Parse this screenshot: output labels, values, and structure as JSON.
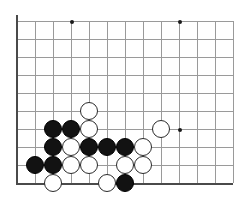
{
  "figure": {
    "type": "go-board-diagram"
  },
  "board": {
    "origin_x": 17,
    "origin_y": 21,
    "cell": 18,
    "cols": 13,
    "rows": 10,
    "line_color": "#9a9a9a",
    "edge_color": "#4a4a4a",
    "background_color": "#ffffff",
    "stone_radius": 9
  },
  "star_points": [
    {
      "col": 3,
      "row": 0
    },
    {
      "col": 9,
      "row": 0
    },
    {
      "col": 9,
      "row": 6
    }
  ],
  "edges": [
    {
      "side": "left",
      "name": "board-left-edge"
    },
    {
      "side": "bottom",
      "name": "board-bottom-edge"
    }
  ],
  "stones": [
    {
      "col": 4,
      "row": 5,
      "color": "white"
    },
    {
      "col": 2,
      "row": 6,
      "color": "black"
    },
    {
      "col": 3,
      "row": 6,
      "color": "black"
    },
    {
      "col": 4,
      "row": 6,
      "color": "white"
    },
    {
      "col": 8,
      "row": 6,
      "color": "white"
    },
    {
      "col": 2,
      "row": 7,
      "color": "black"
    },
    {
      "col": 3,
      "row": 7,
      "color": "white"
    },
    {
      "col": 4,
      "row": 7,
      "color": "black"
    },
    {
      "col": 5,
      "row": 7,
      "color": "black"
    },
    {
      "col": 6,
      "row": 7,
      "color": "black"
    },
    {
      "col": 7,
      "row": 7,
      "color": "white"
    },
    {
      "col": 1,
      "row": 8,
      "color": "black"
    },
    {
      "col": 2,
      "row": 8,
      "color": "black"
    },
    {
      "col": 3,
      "row": 8,
      "color": "white"
    },
    {
      "col": 4,
      "row": 8,
      "color": "white"
    },
    {
      "col": 6,
      "row": 8,
      "color": "white"
    },
    {
      "col": 7,
      "row": 8,
      "color": "white"
    },
    {
      "col": 2,
      "row": 9,
      "color": "white"
    },
    {
      "col": 5,
      "row": 9,
      "color": "white"
    },
    {
      "col": 6,
      "row": 9,
      "color": "black"
    }
  ],
  "counts": {
    "black_stones": 9,
    "white_stones": 11,
    "total_stones": 20
  }
}
